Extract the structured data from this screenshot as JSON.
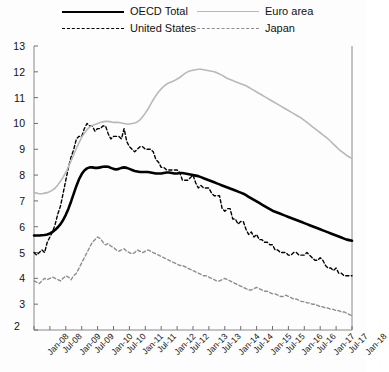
{
  "legend": {
    "items": [
      {
        "label": "OECD Total",
        "style": "solid-thick",
        "color": "#000000"
      },
      {
        "label": "United States",
        "style": "dash-black",
        "color": "#000000"
      },
      {
        "label": "Euro area",
        "style": "solid-gray",
        "color": "#b9b9b9"
      },
      {
        "label": "Japan",
        "style": "dash-gray",
        "color": "#8e8e8e"
      }
    ]
  },
  "chart_data": {
    "type": "line",
    "title": "",
    "subtitle": "",
    "xlabel": "",
    "ylabel": "",
    "ylim": [
      2,
      13
    ],
    "yticks": [
      2,
      3,
      4,
      5,
      6,
      7,
      8,
      9,
      10,
      11,
      12,
      13
    ],
    "grid": false,
    "legend_position": "top",
    "x_tick_labels": [
      "Jan-08",
      "Jul-08",
      "Jan-09",
      "Jul-09",
      "Jan-10",
      "Jul-10",
      "Jan-11",
      "Jul-11",
      "Jan-12",
      "Jul-12",
      "Jan-13",
      "Jul-13",
      "Jan-14",
      "Jul-14",
      "Jan-15",
      "Jul-15",
      "Jan-16",
      "Jul-16",
      "Jan-17",
      "Jul-17",
      "Jan-18"
    ],
    "x_start": "Jan-08",
    "x_end": "Jan-18",
    "x_step_months": 6,
    "series": [
      {
        "name": "OECD Total",
        "color": "#000000",
        "style": "solid",
        "width": 2.6,
        "values": [
          5.66,
          5.66,
          5.66,
          5.67,
          5.68,
          5.7,
          5.74,
          5.8,
          5.88,
          5.98,
          6.1,
          6.26,
          6.46,
          6.7,
          6.98,
          7.28,
          7.58,
          7.84,
          8.04,
          8.18,
          8.26,
          8.3,
          8.3,
          8.28,
          8.28,
          8.3,
          8.32,
          8.33,
          8.32,
          8.28,
          8.24,
          8.22,
          8.24,
          8.28,
          8.3,
          8.28,
          8.24,
          8.2,
          8.16,
          8.14,
          8.12,
          8.12,
          8.12,
          8.12,
          8.1,
          8.08,
          8.06,
          8.06,
          8.06,
          8.08,
          8.1,
          8.1,
          8.08,
          8.06,
          8.06,
          8.08,
          8.08,
          8.06,
          8.04,
          8.02,
          8.0,
          7.98,
          7.96,
          7.92,
          7.88,
          7.84,
          7.8,
          7.76,
          7.72,
          7.68,
          7.64,
          7.6,
          7.56,
          7.52,
          7.48,
          7.44,
          7.4,
          7.36,
          7.32,
          7.28,
          7.22,
          7.16,
          7.1,
          7.04,
          6.98,
          6.92,
          6.86,
          6.8,
          6.74,
          6.68,
          6.62,
          6.58,
          6.54,
          6.5,
          6.46,
          6.42,
          6.38,
          6.34,
          6.3,
          6.26,
          6.22,
          6.18,
          6.14,
          6.1,
          6.06,
          6.02,
          5.98,
          5.94,
          5.9,
          5.86,
          5.82,
          5.78,
          5.74,
          5.7,
          5.66,
          5.62,
          5.58,
          5.54,
          5.5,
          5.48,
          5.46
        ]
      },
      {
        "name": "United States",
        "color": "#000000",
        "style": "dashed",
        "width": 1.4,
        "values": [
          5.0,
          4.9,
          5.0,
          5.1,
          5.0,
          5.4,
          5.6,
          5.8,
          6.1,
          6.5,
          6.8,
          7.3,
          7.8,
          8.3,
          8.7,
          9.0,
          9.4,
          9.5,
          9.5,
          9.8,
          10.0,
          9.9,
          9.9,
          9.7,
          9.8,
          9.8,
          9.9,
          9.9,
          9.6,
          9.4,
          9.5,
          9.5,
          9.5,
          9.4,
          9.8,
          9.3,
          9.1,
          9.0,
          8.9,
          9.0,
          9.1,
          9.1,
          9.0,
          9.0,
          9.0,
          8.9,
          8.6,
          8.5,
          8.3,
          8.3,
          8.2,
          8.2,
          8.2,
          8.2,
          8.2,
          8.1,
          7.8,
          7.8,
          7.8,
          7.9,
          8.0,
          7.7,
          7.5,
          7.6,
          7.5,
          7.5,
          7.5,
          7.3,
          7.2,
          7.2,
          7.2,
          6.7,
          6.6,
          6.7,
          6.7,
          6.3,
          6.3,
          6.1,
          6.2,
          6.2,
          5.9,
          5.7,
          5.8,
          5.6,
          5.7,
          5.5,
          5.5,
          5.4,
          5.4,
          5.3,
          5.3,
          5.1,
          5.1,
          5.0,
          5.0,
          5.0,
          4.9,
          4.9,
          5.0,
          5.0,
          4.9,
          4.9,
          4.9,
          5.0,
          4.9,
          4.8,
          4.7,
          4.7,
          4.8,
          4.7,
          4.5,
          4.4,
          4.4,
          4.3,
          4.4,
          4.2,
          4.2,
          4.1,
          4.1,
          4.1,
          4.1
        ]
      },
      {
        "name": "Euro area",
        "color": "#b9b9b9",
        "style": "solid",
        "width": 1.6,
        "values": [
          7.32,
          7.3,
          7.28,
          7.28,
          7.3,
          7.32,
          7.36,
          7.42,
          7.5,
          7.62,
          7.76,
          7.92,
          8.1,
          8.32,
          8.56,
          8.8,
          9.04,
          9.26,
          9.46,
          9.62,
          9.76,
          9.86,
          9.92,
          9.96,
          10.0,
          10.04,
          10.06,
          10.08,
          10.08,
          10.06,
          10.04,
          10.04,
          10.04,
          10.02,
          10.0,
          9.98,
          9.98,
          10.0,
          10.02,
          10.06,
          10.14,
          10.26,
          10.4,
          10.56,
          10.74,
          10.92,
          11.08,
          11.22,
          11.34,
          11.44,
          11.52,
          11.58,
          11.62,
          11.66,
          11.72,
          11.78,
          11.86,
          11.94,
          12.0,
          12.04,
          12.06,
          12.08,
          12.1,
          12.1,
          12.08,
          12.06,
          12.04,
          12.02,
          12.0,
          11.96,
          11.92,
          11.86,
          11.8,
          11.74,
          11.7,
          11.66,
          11.62,
          11.58,
          11.54,
          11.5,
          11.46,
          11.4,
          11.34,
          11.28,
          11.22,
          11.16,
          11.1,
          11.04,
          10.98,
          10.92,
          10.86,
          10.8,
          10.74,
          10.68,
          10.62,
          10.56,
          10.5,
          10.44,
          10.38,
          10.32,
          10.26,
          10.2,
          10.12,
          10.04,
          9.96,
          9.88,
          9.8,
          9.72,
          9.64,
          9.56,
          9.48,
          9.4,
          9.3,
          9.2,
          9.1,
          9.0,
          8.92,
          8.84,
          8.76,
          8.7,
          8.64
        ]
      },
      {
        "name": "Japan",
        "color": "#8e8e8e",
        "style": "dashed",
        "width": 1.4,
        "values": [
          3.9,
          3.85,
          3.8,
          3.9,
          4.0,
          3.95,
          4.0,
          4.05,
          4.0,
          3.95,
          3.9,
          4.0,
          4.1,
          4.05,
          3.95,
          4.1,
          4.2,
          4.4,
          4.6,
          4.8,
          5.0,
          5.2,
          5.4,
          5.5,
          5.6,
          5.55,
          5.4,
          5.3,
          5.35,
          5.25,
          5.2,
          5.1,
          5.05,
          5.1,
          5.15,
          5.05,
          5.0,
          4.95,
          5.0,
          5.1,
          5.05,
          5.0,
          5.05,
          5.1,
          5.05,
          5.0,
          4.95,
          4.9,
          4.85,
          4.8,
          4.75,
          4.7,
          4.65,
          4.6,
          4.55,
          4.5,
          4.5,
          4.45,
          4.4,
          4.35,
          4.3,
          4.25,
          4.2,
          4.15,
          4.1,
          4.1,
          4.05,
          4.0,
          3.95,
          3.9,
          3.9,
          3.95,
          4.0,
          3.95,
          3.9,
          3.85,
          3.8,
          3.75,
          3.7,
          3.65,
          3.6,
          3.55,
          3.55,
          3.6,
          3.65,
          3.6,
          3.55,
          3.5,
          3.5,
          3.45,
          3.4,
          3.4,
          3.35,
          3.3,
          3.3,
          3.35,
          3.3,
          3.25,
          3.2,
          3.2,
          3.15,
          3.1,
          3.1,
          3.05,
          3.05,
          3.0,
          3.0,
          2.95,
          2.9,
          2.9,
          2.85,
          2.85,
          2.8,
          2.8,
          2.75,
          2.75,
          2.7,
          2.7,
          2.65,
          2.6,
          2.55
        ]
      }
    ]
  }
}
